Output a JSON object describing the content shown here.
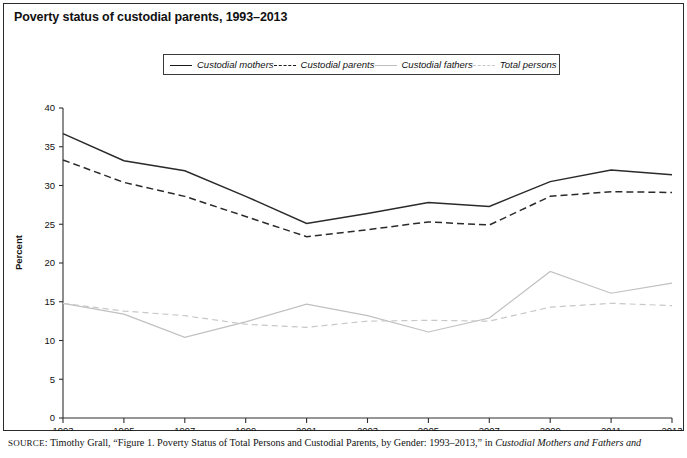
{
  "title": "Poverty status of custodial parents, 1993–2013",
  "legend": {
    "position": "top-center",
    "items": [
      {
        "label": "Custodial mothers",
        "style": "solid-dark",
        "color": "#2a2a2a"
      },
      {
        "label": "Custodial parents",
        "style": "dashed-dark",
        "color": "#2a2a2a"
      },
      {
        "label": "Custodial fathers",
        "style": "solid-light",
        "color": "#c0c0c0"
      },
      {
        "label": "Total persons",
        "style": "dashed-light",
        "color": "#c8c8c8"
      }
    ]
  },
  "source": {
    "prefix": "SOURCE",
    "text_before_italic": ": Timothy Grall, “Figure 1. Poverty Status of Total Persons and Custodial Parents, by Gender: 1993–2013,” in ",
    "italic_text": "Custodial Mothers and Fathers and"
  },
  "chart_data": {
    "type": "line",
    "title": "Poverty status of custodial parents, 1993–2013",
    "xlabel": "",
    "ylabel": "Percent",
    "x": [
      1993,
      1995,
      1997,
      1999,
      2001,
      2003,
      2005,
      2007,
      2009,
      2011,
      2013
    ],
    "xtick_labels": [
      "1993",
      "1995",
      "1997",
      "1999",
      "2001",
      "2003",
      "2005",
      "2007",
      "2009",
      "2011",
      "2013"
    ],
    "xlim": [
      1993,
      2013
    ],
    "ylim": [
      0,
      40
    ],
    "yticks": [
      0,
      5,
      10,
      15,
      20,
      25,
      30,
      35,
      40
    ],
    "ytick_labels": [
      "0",
      "5",
      "10",
      "15",
      "20",
      "25",
      "30",
      "35",
      "40"
    ],
    "grid": false,
    "legend_position": "top-center",
    "series": [
      {
        "name": "Custodial mothers",
        "style": "solid",
        "color": "#2a2a2a",
        "values": [
          36.7,
          33.2,
          31.9,
          28.6,
          25.1,
          26.4,
          27.8,
          27.3,
          30.5,
          32.0,
          31.4
        ]
      },
      {
        "name": "Custodial parents",
        "style": "dashed",
        "color": "#2a2a2a",
        "values": [
          33.3,
          30.4,
          28.6,
          26.0,
          23.4,
          24.3,
          25.3,
          24.9,
          28.6,
          29.2,
          29.1
        ]
      },
      {
        "name": "Custodial fathers",
        "style": "solid",
        "color": "#c0c0c0",
        "values": [
          14.8,
          13.4,
          10.4,
          12.4,
          14.7,
          13.2,
          11.1,
          12.9,
          18.9,
          16.1,
          17.4
        ]
      },
      {
        "name": "Total persons",
        "style": "dashed",
        "color": "#c8c8c8",
        "values": [
          14.8,
          13.8,
          13.2,
          12.1,
          11.7,
          12.5,
          12.6,
          12.5,
          14.3,
          14.8,
          14.5
        ]
      }
    ]
  }
}
